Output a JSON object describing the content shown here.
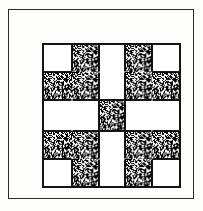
{
  "figure": {
    "background_color": "#fdfdfc",
    "ink_color": "#161616"
  },
  "outer_frame": {
    "name": "border-rectangle",
    "line_color": "#2b2b2b",
    "line_width": "1px"
  },
  "block": {
    "name": "quilt-block",
    "line_color": "#121212",
    "line_width": "1.5px",
    "rows": 5,
    "columns": 5,
    "values": {
      "light": {
        "label": "light",
        "fill": "#ffffff"
      },
      "dark": {
        "label": "stipple",
        "fill": "#1a1a1a"
      }
    },
    "layout": [
      [
        "light",
        "dark",
        "light",
        "dark",
        "light"
      ],
      [
        "dark",
        "dark",
        "light",
        "dark",
        "dark"
      ],
      [
        "light",
        "light",
        "dark",
        "light",
        "light"
      ],
      [
        "dark",
        "dark",
        "light",
        "dark",
        "dark"
      ],
      [
        "light",
        "dark",
        "light",
        "dark",
        "light"
      ]
    ]
  },
  "chart_data": {
    "type": "heatmap",
    "xlabel": "",
    "ylabel": "",
    "categories": [
      "c1",
      "c2",
      "c3",
      "c4",
      "c5"
    ],
    "rows": [
      "r1",
      "r2",
      "r3",
      "r4",
      "r5"
    ],
    "legend": [
      "light",
      "stipple"
    ],
    "grid": true,
    "values": [
      [
        0,
        1,
        0,
        1,
        0
      ],
      [
        1,
        1,
        0,
        1,
        1
      ],
      [
        0,
        0,
        1,
        0,
        0
      ],
      [
        1,
        1,
        0,
        1,
        1
      ],
      [
        0,
        1,
        0,
        1,
        0
      ]
    ]
  }
}
